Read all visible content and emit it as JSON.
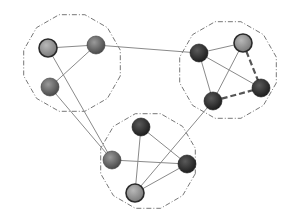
{
  "diagram": {
    "type": "clustered-network-graph",
    "colors": {
      "background": "#ffffff",
      "edge": "#8a8a8a",
      "dashed_edge": "#555555",
      "cluster_outline": "#777777"
    },
    "node_styles": {
      "dark": {
        "stops": [
          "#5a5a5a",
          "#1e1e1e"
        ],
        "stroke": "#1a1a1a"
      },
      "medium": {
        "stops": [
          "#9a9a9a",
          "#4a4a4a"
        ],
        "stroke": "#3a3a3a"
      },
      "light": {
        "stops": [
          "#b8b8b8",
          "#7a7a7a"
        ],
        "stroke": "#2a2a2a"
      }
    },
    "clusters": [
      {
        "id": "c1",
        "name": "left-cluster",
        "nodes": [
          "n1",
          "n2",
          "n3"
        ]
      },
      {
        "id": "c2",
        "name": "right-cluster",
        "nodes": [
          "n4",
          "n5",
          "n6",
          "n7"
        ]
      },
      {
        "id": "c3",
        "name": "bottom-cluster",
        "nodes": [
          "n8",
          "n9",
          "n10",
          "n11"
        ]
      }
    ],
    "nodes": [
      {
        "id": "n1",
        "cluster": "c1",
        "style": "light"
      },
      {
        "id": "n2",
        "cluster": "c1",
        "style": "medium"
      },
      {
        "id": "n3",
        "cluster": "c1",
        "style": "medium"
      },
      {
        "id": "n4",
        "cluster": "c2",
        "style": "dark"
      },
      {
        "id": "n5",
        "cluster": "c2",
        "style": "light"
      },
      {
        "id": "n6",
        "cluster": "c2",
        "style": "dark"
      },
      {
        "id": "n7",
        "cluster": "c2",
        "style": "dark"
      },
      {
        "id": "n8",
        "cluster": "c3",
        "style": "dark"
      },
      {
        "id": "n9",
        "cluster": "c3",
        "style": "medium"
      },
      {
        "id": "n10",
        "cluster": "c3",
        "style": "dark"
      },
      {
        "id": "n11",
        "cluster": "c3",
        "style": "light"
      }
    ],
    "edges": [
      {
        "from": "n1",
        "to": "n2",
        "style": "solid"
      },
      {
        "from": "n2",
        "to": "n3",
        "style": "solid"
      },
      {
        "from": "n1",
        "to": "n9",
        "style": "solid"
      },
      {
        "from": "n3",
        "to": "n9",
        "style": "solid"
      },
      {
        "from": "n2",
        "to": "n4",
        "style": "solid"
      },
      {
        "from": "n4",
        "to": "n5",
        "style": "solid"
      },
      {
        "from": "n4",
        "to": "n7",
        "style": "solid"
      },
      {
        "from": "n4",
        "to": "n6",
        "style": "solid"
      },
      {
        "from": "n5",
        "to": "n7",
        "style": "solid"
      },
      {
        "from": "n5",
        "to": "n6",
        "style": "dashed"
      },
      {
        "from": "n7",
        "to": "n6",
        "style": "dashed"
      },
      {
        "from": "n8",
        "to": "n11",
        "style": "solid"
      },
      {
        "from": "n8",
        "to": "n10",
        "style": "solid"
      },
      {
        "from": "n9",
        "to": "n10",
        "style": "solid"
      },
      {
        "from": "n11",
        "to": "n10",
        "style": "solid"
      },
      {
        "from": "n11",
        "to": "n7",
        "style": "solid"
      }
    ]
  }
}
